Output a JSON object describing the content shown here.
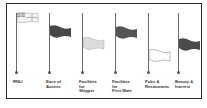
{
  "diagram": {
    "type": "flag-rating-chart",
    "flags": [
      {
        "label": "RNLI",
        "style": "white-ensign",
        "fill": "#f0f0f0",
        "height_level": "top"
      },
      {
        "label": "Ease of\nAccess",
        "style": "solid",
        "fill": "#4a4a4a",
        "height_level": "high"
      },
      {
        "label": "Facilities\nfor\nSkipper",
        "style": "solid",
        "fill": "#d8d8d8",
        "height_level": "mid"
      },
      {
        "label": "Facilities\nfor\nFirst Mate",
        "style": "solid",
        "fill": "#5a5a5a",
        "height_level": "high"
      },
      {
        "label": "Pubs &\nRestaurants",
        "style": "outline",
        "fill": "#ffffff",
        "height_level": "low"
      },
      {
        "label": "Beauty &\nInterest",
        "style": "solid",
        "fill": "#4e4e4e",
        "height_level": "mid"
      }
    ]
  }
}
